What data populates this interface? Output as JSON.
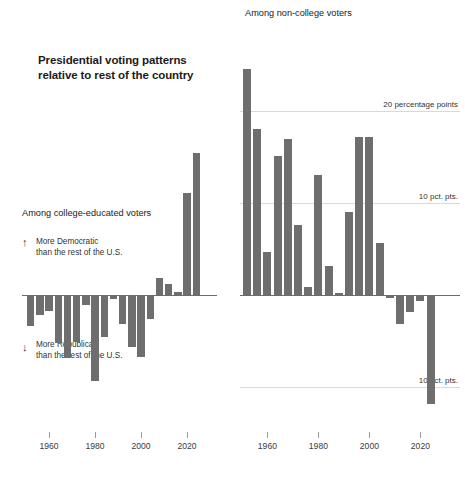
{
  "figure": {
    "main_title_line1": "Presidential voting patterns",
    "main_title_line2": "relative to rest of the country",
    "accent_color": "#6e6e6e",
    "grid_color": "#d9d9d9",
    "zero_line_color": "#6b6b6b"
  },
  "annotations": {
    "up_arrow": "↑",
    "down_arrow": "↓",
    "democratic_line1": "More Democratic",
    "democratic_line2": "than the rest of the U.S.",
    "republican_line1": "More Republican",
    "republican_line2": "than the rest of the U.S."
  },
  "axis": {
    "tick_labels": [
      "1960",
      "1980",
      "2000",
      "2020"
    ],
    "tick_years": [
      1960,
      1980,
      2000,
      2020
    ]
  },
  "chart_data": [
    {
      "type": "bar",
      "id": "college-educated",
      "title": "Among college-educated voters",
      "xlabel": "",
      "ylabel": "percentage points relative to rest of the country",
      "ylim": [
        -12,
        26
      ],
      "xlim": [
        1950,
        2026
      ],
      "grid": false,
      "gridlines": [],
      "categories": [
        1952,
        1956,
        1960,
        1964,
        1968,
        1972,
        1976,
        1980,
        1984,
        1988,
        1992,
        1996,
        2000,
        2004,
        2008,
        2012,
        2016,
        2020,
        2024
      ],
      "values": [
        -3.4,
        -2.2,
        -1.7,
        -5.2,
        -6.8,
        -5.1,
        -1.1,
        -9.4,
        -4.6,
        -0.4,
        -3.2,
        -5.6,
        -6.7,
        -2.6,
        1.9,
        1.2,
        0.3,
        11.1,
        15.4
      ]
    },
    {
      "type": "bar",
      "id": "non-college",
      "title": "Among non-college voters",
      "xlabel": "",
      "ylabel": "percentage points relative to rest of the country",
      "ylim": [
        -12,
        26
      ],
      "xlim": [
        1950,
        2026
      ],
      "grid": true,
      "gridlines": [
        {
          "value": 20,
          "label": "20 percentage points"
        },
        {
          "value": 10,
          "label": "10 pct. pts."
        },
        {
          "value": -10,
          "label": "10 pct. pts."
        }
      ],
      "categories": [
        1952,
        1956,
        1960,
        1964,
        1968,
        1972,
        1976,
        1980,
        1984,
        1988,
        1992,
        1996,
        2000,
        2004,
        2008,
        2012,
        2016,
        2020,
        2024
      ],
      "values": [
        24.6,
        18.0,
        4.7,
        15.1,
        17.0,
        7.6,
        0.9,
        13.0,
        3.2,
        0.2,
        9.0,
        17.2,
        17.2,
        5.6,
        -0.3,
        -3.1,
        -1.8,
        -0.6,
        -11.8
      ]
    }
  ]
}
